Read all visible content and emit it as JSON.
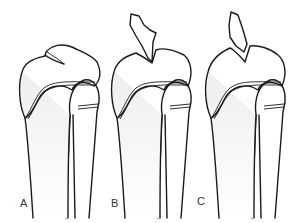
{
  "figure": {
    "panels": [
      {
        "label": "A",
        "fragment": "non-displaced"
      },
      {
        "label": "B",
        "fragment": "displaced, angled"
      },
      {
        "label": "C",
        "fragment": "displaced, upright"
      }
    ]
  },
  "colors": {
    "line": "#1a1a1a",
    "bone_fill": "#f3f3f3",
    "epiphysis_stipple": "#9a9a9a",
    "background": "#ffffff"
  }
}
